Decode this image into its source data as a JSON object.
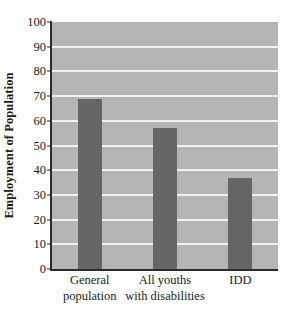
{
  "chart_data": {
    "type": "bar",
    "title": "",
    "xlabel": "",
    "ylabel": "Employment of Population",
    "categories": [
      "General\npopulation",
      "All youths\nwith disabilities",
      "IDD"
    ],
    "values": [
      69,
      57,
      37
    ],
    "ylim": [
      0,
      100
    ],
    "yticks": [
      0,
      10,
      20,
      30,
      40,
      50,
      60,
      70,
      80,
      90,
      100
    ],
    "ytick_labels": [
      "0",
      "10",
      "20",
      "30",
      "40",
      "50",
      "60",
      "70",
      "80",
      "90",
      "100"
    ],
    "grid": true,
    "legend": "none",
    "colors": {
      "bar": "#666666",
      "plot_background": "#b5b5b5",
      "gridline": "#f2f2f2",
      "axis": "#2b2b2b",
      "text": "#1a1a1a",
      "figure_background": "#ffffff"
    }
  }
}
